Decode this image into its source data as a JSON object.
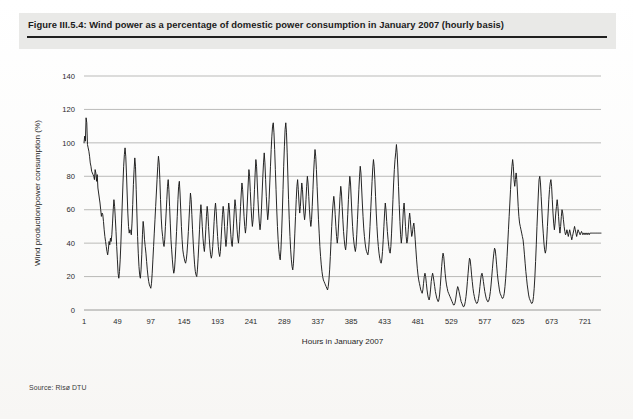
{
  "figure": {
    "title": "Figure III.5.4: Wind power as a percentage of domestic power consumption in January 2007 (hourly basis)",
    "source": "Source: Risø DTU"
  },
  "chart_data": {
    "type": "line",
    "title": "Wind power as a percentage of domestic power consumption in January 2007 (hourly basis)",
    "xlabel": "Hours in January 2007",
    "ylabel": "Wind production/power consumption (%)",
    "xlim": [
      1,
      744
    ],
    "ylim": [
      0,
      140
    ],
    "grid": true,
    "legend": false,
    "y_ticks": [
      0,
      20,
      40,
      60,
      80,
      100,
      120,
      140
    ],
    "x_ticks": [
      1,
      49,
      97,
      145,
      193,
      241,
      289,
      337,
      385,
      433,
      481,
      529,
      577,
      625,
      673,
      721
    ],
    "series": [
      {
        "name": "Wind production / power consumption",
        "color": "#1a1a1a",
        "x_start": 1,
        "x_step": 1,
        "values": [
          100,
          104,
          101,
          115,
          112,
          99,
          97,
          95,
          92,
          88,
          86,
          83,
          82,
          81,
          80,
          78,
          84,
          82,
          77,
          81,
          73,
          70,
          67,
          64,
          60,
          56,
          58,
          57,
          53,
          48,
          44,
          41,
          38,
          35,
          33,
          36,
          41,
          39,
          43,
          41,
          45,
          52,
          60,
          66,
          62,
          55,
          47,
          38,
          30,
          22,
          19,
          23,
          30,
          40,
          52,
          64,
          76,
          86,
          93,
          97,
          92,
          82,
          70,
          58,
          50,
          46,
          48,
          47,
          45,
          52,
          63,
          75,
          84,
          91,
          86,
          72,
          58,
          44,
          34,
          26,
          21,
          19,
          24,
          33,
          45,
          53,
          49,
          42,
          38,
          34,
          29,
          24,
          20,
          17,
          15,
          14,
          13,
          16,
          22,
          30,
          38,
          46,
          54,
          62,
          70,
          78,
          86,
          92,
          88,
          78,
          66,
          55,
          48,
          44,
          40,
          38,
          42,
          50,
          58,
          66,
          74,
          78,
          72,
          62,
          52,
          42,
          36,
          30,
          25,
          22,
          24,
          30,
          38,
          47,
          56,
          66,
          74,
          77,
          70,
          60,
          50,
          42,
          36,
          33,
          31,
          29,
          28,
          30,
          34,
          40,
          47,
          55,
          63,
          70,
          66,
          57,
          48,
          40,
          33,
          27,
          23,
          21,
          20,
          24,
          31,
          39,
          48,
          57,
          63,
          58,
          50,
          43,
          38,
          35,
          40,
          48,
          56,
          62,
          58,
          50,
          43,
          37,
          33,
          31,
          33,
          38,
          45,
          53,
          60,
          64,
          59,
          51,
          44,
          38,
          34,
          32,
          35,
          42,
          50,
          57,
          62,
          58,
          50,
          43,
          38,
          42,
          50,
          58,
          64,
          60,
          52,
          45,
          40,
          38,
          44,
          52,
          60,
          66,
          62,
          55,
          48,
          43,
          40,
          45,
          53,
          62,
          70,
          76,
          72,
          64,
          56,
          50,
          46,
          50,
          58,
          67,
          76,
          84,
          80,
          71,
          62,
          55,
          50,
          54,
          62,
          72,
          82,
          90,
          86,
          76,
          66,
          58,
          52,
          48,
          52,
          60,
          70,
          80,
          88,
          94,
          88,
          78,
          68,
          60,
          54,
          58,
          66,
          76,
          86,
          96,
          104,
          110,
          112,
          106,
          96,
          84,
          72,
          60,
          50,
          42,
          36,
          32,
          30,
          36,
          46,
          58,
          72,
          86,
          98,
          108,
          112,
          106,
          94,
          80,
          66,
          54,
          44,
          36,
          30,
          26,
          24,
          28,
          36,
          46,
          56,
          66,
          74,
          78,
          72,
          64,
          58,
          62,
          70,
          76,
          72,
          64,
          58,
          54,
          58,
          66,
          74,
          80,
          76,
          68,
          60,
          54,
          50,
          54,
          62,
          72,
          82,
          90,
          96,
          92,
          84,
          74,
          64,
          54,
          46,
          38,
          32,
          27,
          23,
          20,
          18,
          17,
          16,
          15,
          14,
          13,
          12,
          14,
          18,
          24,
          32,
          41,
          50,
          58,
          64,
          68,
          64,
          57,
          50,
          44,
          40,
          44,
          52,
          60,
          68,
          74,
          70,
          62,
          54,
          47,
          42,
          38,
          36,
          40,
          48,
          57,
          66,
          74,
          80,
          76,
          67,
          58,
          50,
          44,
          40,
          37,
          35,
          38,
          45,
          54,
          63,
          72,
          80,
          86,
          82,
          73,
          64,
          56,
          49,
          44,
          40,
          37,
          35,
          34,
          33,
          36,
          42,
          50,
          59,
          68,
          77,
          85,
          90,
          86,
          78,
          68,
          58,
          50,
          43,
          38,
          34,
          31,
          29,
          28,
          30,
          35,
          42,
          50,
          58,
          64,
          60,
          53,
          47,
          42,
          38,
          35,
          34,
          38,
          46,
          56,
          66,
          76,
          84,
          90,
          94,
          99,
          94,
          85,
          74,
          63,
          53,
          45,
          40,
          44,
          52,
          60,
          64,
          58,
          50,
          44,
          40,
          42,
          48,
          54,
          58,
          54,
          48,
          44,
          46,
          50,
          52,
          48,
          42,
          36,
          30,
          25,
          21,
          18,
          16,
          14,
          12,
          11,
          10,
          12,
          16,
          20,
          22,
          20,
          16,
          12,
          9,
          7,
          6,
          8,
          12,
          17,
          20,
          22,
          20,
          17,
          14,
          11,
          9,
          7,
          6,
          5,
          6,
          9,
          14,
          20,
          26,
          31,
          34,
          32,
          27,
          22,
          18,
          15,
          13,
          11,
          10,
          9,
          8,
          7,
          6,
          5,
          4,
          3,
          3,
          4,
          6,
          9,
          12,
          14,
          13,
          11,
          9,
          7,
          5,
          4,
          3,
          2,
          2,
          3,
          5,
          8,
          12,
          17,
          22,
          27,
          31,
          30,
          26,
          21,
          17,
          13,
          10,
          8,
          6,
          5,
          4,
          4,
          5,
          7,
          10,
          14,
          18,
          21,
          22,
          20,
          17,
          14,
          11,
          9,
          7,
          6,
          5,
          5,
          6,
          8,
          11,
          15,
          20,
          25,
          30,
          34,
          37,
          36,
          32,
          27,
          22,
          18,
          15,
          12,
          10,
          9,
          8,
          7,
          7,
          8,
          10,
          14,
          19,
          25,
          32,
          40,
          48,
          56,
          64,
          72,
          80,
          86,
          90,
          86,
          78,
          74,
          78,
          82,
          78,
          70,
          62,
          56,
          52,
          50,
          48,
          46,
          44,
          42,
          38,
          33,
          28,
          23,
          19,
          15,
          12,
          9,
          7,
          6,
          5,
          4,
          4,
          5,
          8,
          13,
          20,
          29,
          39,
          50,
          60,
          70,
          78,
          80,
          76,
          68,
          60,
          52,
          46,
          40,
          36,
          34,
          36,
          42,
          50,
          58,
          66,
          72,
          76,
          78,
          74,
          66,
          58,
          52,
          48,
          52,
          58,
          62,
          66,
          62,
          56,
          50,
          46,
          50,
          56,
          60,
          58,
          54,
          50,
          47,
          45,
          46,
          48,
          46,
          44,
          46,
          48,
          46,
          44,
          42,
          44,
          46,
          48,
          50,
          48,
          46,
          44,
          46,
          48,
          47,
          46,
          45,
          46,
          47,
          46,
          45,
          46,
          46,
          45,
          46,
          46,
          45,
          46,
          46,
          45,
          46,
          46,
          46,
          46,
          46,
          46,
          46,
          46,
          46,
          46,
          46,
          46,
          46,
          46,
          46,
          46,
          46
        ]
      }
    ]
  }
}
